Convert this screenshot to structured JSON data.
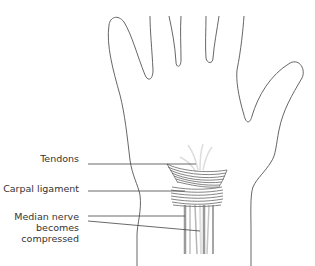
{
  "labels": {
    "tendons": "Tendons",
    "carpal_ligament": "Carpal ligament",
    "median_nerve_line1": "Median nerve",
    "median_nerve_line2": "becomes",
    "median_nerve_line3": "compressed"
  },
  "colors": {
    "outline": "#555555",
    "leader_line": "#444444",
    "tendon_gray": "#9a9a9a",
    "tendon_light": "#cfcfcf",
    "ligament_band": "#777777",
    "text": "#333333"
  }
}
